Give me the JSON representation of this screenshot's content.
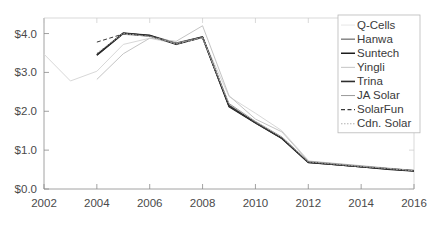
{
  "chart_data": {
    "type": "line",
    "title": "",
    "subtitle": "",
    "xlabel": "",
    "ylabel": "",
    "xlim": [
      2002,
      2016
    ],
    "ylim": [
      0.0,
      4.4
    ],
    "grid": false,
    "legend_position": "top-right",
    "xticks": [
      2002,
      2004,
      2006,
      2008,
      2010,
      2012,
      2014,
      2016
    ],
    "xtick_labels": [
      "2002",
      "2004",
      "2006",
      "2008",
      "2010",
      "2012",
      "2014",
      "2016"
    ],
    "yticks": [
      0.0,
      1.0,
      2.0,
      3.0,
      4.0
    ],
    "ytick_labels": [
      "$0.0",
      "$1.0",
      "$2.0",
      "$3.0",
      "$4.0"
    ],
    "series": [
      {
        "name": "Q-Cells",
        "color": "#d8d8d8",
        "width": 1.0,
        "dash": "none",
        "x": [
          2002,
          2003,
          2004,
          2005,
          2006,
          2007,
          2008,
          2009,
          2010,
          2011,
          2012
        ],
        "values": [
          3.47,
          2.78,
          3.03,
          3.72,
          3.88,
          3.74,
          3.91,
          2.38,
          1.95,
          1.5,
          0.74
        ]
      },
      {
        "name": "Hanwa",
        "color": "#5a5a5a",
        "width": 1.0,
        "dash": "none",
        "x": [
          2004,
          2005,
          2006,
          2007,
          2008,
          2009,
          2010,
          2011,
          2012,
          2013,
          2014,
          2015,
          2016
        ],
        "values": [
          3.46,
          4.02,
          3.96,
          3.76,
          3.92,
          2.16,
          1.72,
          1.32,
          0.7,
          0.64,
          0.58,
          0.52,
          0.47
        ]
      },
      {
        "name": "Suntech",
        "color": "#1c1c1c",
        "width": 1.4,
        "dash": "none",
        "x": [
          2004,
          2005,
          2006,
          2007,
          2008,
          2009,
          2010,
          2011,
          2012,
          2013,
          2014,
          2015,
          2016
        ],
        "values": [
          3.44,
          4.0,
          3.95,
          3.72,
          3.9,
          2.12,
          1.7,
          1.3,
          0.68,
          0.63,
          0.57,
          0.51,
          0.46
        ]
      },
      {
        "name": "Yingli",
        "color": "#c4c4c4",
        "width": 1.0,
        "dash": "none",
        "x": [
          2004,
          2005,
          2006,
          2007,
          2008,
          2009,
          2010,
          2011,
          2012,
          2013,
          2014,
          2015,
          2016
        ],
        "values": [
          2.82,
          3.48,
          3.88,
          3.8,
          4.2,
          2.4,
          1.8,
          1.47,
          0.72,
          0.66,
          0.6,
          0.54,
          0.48
        ]
      },
      {
        "name": "Trina",
        "color": "#2e2e2e",
        "width": 1.5,
        "dash": "none",
        "x": [
          2004,
          2005,
          2006,
          2007,
          2008,
          2009,
          2010,
          2011,
          2012,
          2013,
          2014,
          2015,
          2016
        ],
        "values": [
          3.45,
          4.01,
          3.94,
          3.74,
          3.91,
          2.14,
          1.71,
          1.31,
          0.69,
          0.63,
          0.57,
          0.52,
          0.47
        ]
      },
      {
        "name": "JA Solar",
        "color": "#9a9a9a",
        "width": 1.0,
        "dash": "none",
        "x": [
          2005,
          2006,
          2007,
          2008,
          2009,
          2010,
          2011,
          2012,
          2013,
          2014,
          2015,
          2016
        ],
        "values": [
          3.98,
          3.93,
          3.75,
          3.9,
          2.2,
          1.74,
          1.34,
          0.71,
          0.65,
          0.59,
          0.53,
          0.48
        ]
      },
      {
        "name": "SolarFun",
        "color": "#3a3a3a",
        "width": 1.0,
        "dash": "4,2.5",
        "x": [
          2004,
          2005,
          2006,
          2007,
          2008,
          2009,
          2010,
          2011,
          2012,
          2013,
          2014,
          2015,
          2016
        ],
        "values": [
          3.78,
          3.99,
          3.94,
          3.73,
          3.9,
          2.13,
          1.7,
          1.3,
          0.69,
          0.63,
          0.57,
          0.52,
          0.47
        ]
      },
      {
        "name": "Cdn. Solar",
        "color": "#b0b0b0",
        "width": 0.9,
        "dash": "1.5,1.5",
        "x": [
          2004,
          2005,
          2006,
          2007,
          2008,
          2009,
          2010,
          2011,
          2012,
          2013,
          2014,
          2015,
          2016
        ],
        "values": [
          3.5,
          4.0,
          3.92,
          3.73,
          3.89,
          2.18,
          1.73,
          1.33,
          0.7,
          0.64,
          0.58,
          0.53,
          0.47
        ]
      }
    ]
  },
  "legend": {
    "entries": [
      {
        "label": "Q-Cells",
        "color": "#e6e6e6",
        "dash": "none",
        "width": 1.0
      },
      {
        "label": "Hanwa",
        "color": "#5a5a5a",
        "dash": "none",
        "width": 1.1
      },
      {
        "label": "Suntech",
        "color": "#1c1c1c",
        "dash": "none",
        "width": 1.5
      },
      {
        "label": "Yingli",
        "color": "#c4c4c4",
        "dash": "none",
        "width": 1.0
      },
      {
        "label": "Trina",
        "color": "#2e2e2e",
        "dash": "none",
        "width": 1.6
      },
      {
        "label": "JA Solar",
        "color": "#9a9a9a",
        "dash": "none",
        "width": 1.0
      },
      {
        "label": "SolarFun",
        "color": "#3a3a3a",
        "dash": "4,2.5",
        "width": 1.1
      },
      {
        "label": "Cdn. Solar",
        "color": "#b0b0b0",
        "dash": "1.5,1.5",
        "width": 1.0
      }
    ]
  },
  "colors": {
    "background": "#ffffff",
    "axis": "#8a8a8a",
    "tick_text": "#4a4a4a",
    "legend_border": "#b8b8b8"
  }
}
